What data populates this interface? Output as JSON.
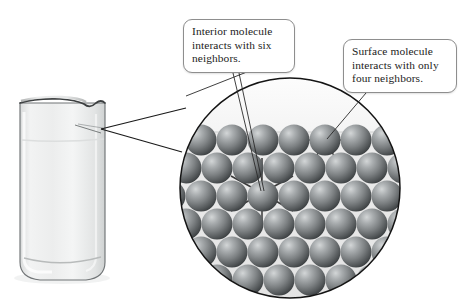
{
  "figure": {
    "background_color": "#ffffff"
  },
  "callouts": [
    {
      "id": "interior",
      "name": "callout-interior-molecule",
      "lines": [
        "Interior molecule",
        "interacts with six",
        "neighbors."
      ],
      "border_color": "#8e8e8e",
      "fill_color": "#ffffff",
      "text_color": "#1c1c1c"
    },
    {
      "id": "surface",
      "name": "callout-surface-molecule",
      "lines": [
        "Surface molecule",
        "interacts with only",
        "four neighbors."
      ],
      "border_color": "#8e8e8e",
      "fill_color": "#ffffff",
      "text_color": "#1c1c1c"
    }
  ],
  "beaker": {
    "label": "glass-beaker-with-liquid",
    "glass_color": "#e9eaea",
    "outline_color": "#4a4a4a",
    "liquid_color": "#f1f2f2",
    "has_pour_spout": true
  },
  "magnifier": {
    "label": "magnified-circle-view",
    "center_x": 290,
    "center_y": 188,
    "radius": 110,
    "outline_color": "#1a1a1a",
    "interior_fill": "#ececec",
    "vapor_fill": "#f7f7f7",
    "surface_level_y": 132
  },
  "molecules": {
    "sphere_color_light": "#b9bcbd",
    "sphere_color_mid": "#7d8183",
    "sphere_color_dark": "#3f4345",
    "bond_color": "#3a3a3a",
    "interior_molecule_bond_count": 6,
    "surface_molecule_bond_count": 4,
    "interior_molecule": {
      "x": 262,
      "y": 193
    },
    "surface_molecule": {
      "x": 325,
      "y": 140
    }
  },
  "leader_lines": {
    "color": "#2a2a2a",
    "count": 4
  }
}
